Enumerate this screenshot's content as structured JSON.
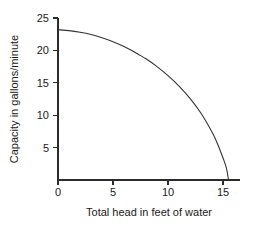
{
  "chart_data": {
    "type": "line",
    "title": "",
    "xlabel": "Total head in feet of water",
    "ylabel": "Capacity in gallons/minute",
    "xlim": [
      0,
      16
    ],
    "ylim": [
      0,
      25
    ],
    "xticks": [
      0,
      5,
      10,
      15
    ],
    "yticks": [
      0,
      5,
      10,
      15,
      20,
      25
    ],
    "xtick_labels": [
      "0",
      "5",
      "10",
      "15"
    ],
    "ytick_labels": [
      "0",
      "5",
      "10",
      "15",
      "20",
      "25"
    ],
    "grid": false,
    "legend": false,
    "line_color": "#333333",
    "background_color": "#ffffff",
    "axis_color": "#2b2b2b",
    "series": [
      {
        "name": "Pump capacity curve",
        "x": [
          0,
          1,
          2,
          3,
          4,
          5,
          6,
          7,
          8,
          9,
          10,
          11,
          12,
          13,
          14,
          14.5,
          15,
          15.3,
          15.5
        ],
        "y": [
          23.2,
          23.05,
          22.8,
          22.45,
          21.95,
          21.35,
          20.6,
          19.7,
          18.7,
          17.5,
          16.1,
          14.5,
          12.6,
          10.3,
          7.4,
          5.6,
          3.4,
          1.9,
          0.0
        ]
      }
    ]
  }
}
